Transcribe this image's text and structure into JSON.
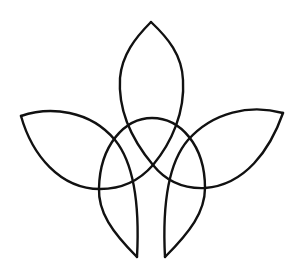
{
  "figure": {
    "stroke_color": "#111111",
    "background_color": "#ffffff",
    "petals": [
      "top",
      "left",
      "right",
      "bottom-left",
      "bottom-right"
    ]
  }
}
